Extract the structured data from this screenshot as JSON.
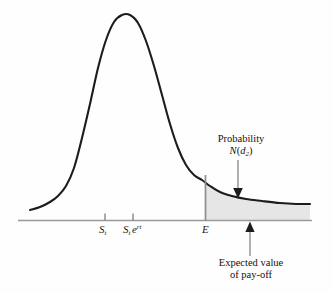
{
  "figure": {
    "title": "",
    "background_color": "#fefefe",
    "curve_color": "#1c1c1c",
    "shade_color": "#e6e6e6",
    "axis_color": "#9a9a9a"
  },
  "axis": {
    "name": "horizontal-axis",
    "ticks": [
      {
        "id": "tick-st",
        "label_main": "S",
        "label_sub": "t",
        "label_sup": "",
        "x": 105
      },
      {
        "id": "tick-st-ert",
        "label_main": "S",
        "label_sub": "t",
        "label_sup": "rt",
        "label_exp_base": "e",
        "x": 133
      },
      {
        "id": "tick-e",
        "label_main": "E",
        "label_sub": "",
        "label_sup": "",
        "x": 205
      }
    ]
  },
  "annotations": {
    "probability": {
      "line1": "Probability",
      "line2_func": "N",
      "line2_open": "(",
      "line2_var": "d",
      "line2_sub": "2",
      "line2_close": ")",
      "arrow_direction": "down",
      "arrow_x": 238
    },
    "expected_value": {
      "line1": "Expected value",
      "line2": "of pay-off",
      "arrow_direction": "up",
      "arrow_x": 250
    }
  },
  "chart_data": {
    "type": "line",
    "title": "",
    "xlabel": "",
    "ylabel": "",
    "grid": false,
    "legend": "none",
    "xlim": [
      18,
      312
    ],
    "ylim_pixels": [
      220,
      15
    ],
    "curve_name": "lognormal-density",
    "x": [
      30,
      40,
      50,
      58,
      66,
      74,
      82,
      90,
      98,
      106,
      114,
      122,
      130,
      138,
      146,
      154,
      162,
      170,
      178,
      186,
      194,
      202,
      210,
      220,
      232,
      246,
      262,
      280,
      296,
      310
    ],
    "y": [
      210,
      207,
      202,
      196,
      186,
      168,
      138,
      104,
      68,
      40,
      22,
      15,
      15,
      23,
      41,
      66,
      95,
      124,
      148,
      165,
      175,
      180,
      186,
      192,
      196,
      199,
      201,
      203,
      204,
      204
    ],
    "shaded_region": {
      "name": "tail-probability-area",
      "x_start": 205,
      "x_end": 310,
      "fill": "#e6e6e6",
      "meaning": "Probability N(d2)"
    },
    "markers": [
      {
        "label": "S_t",
        "x": 105
      },
      {
        "label": "S_t e^rt",
        "x": 133
      },
      {
        "label": "E",
        "x": 205
      },
      {
        "label": "Expected value of pay-off",
        "x": 250
      }
    ]
  }
}
